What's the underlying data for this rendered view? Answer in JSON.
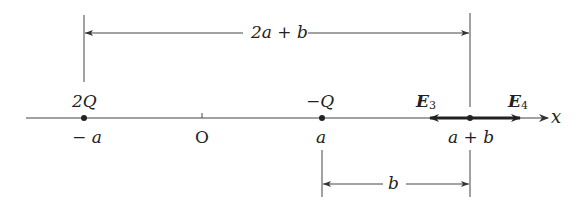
{
  "diagram": {
    "type": "point-charges-on-x-axis",
    "axis": {
      "label": "x"
    },
    "ticks": [
      {
        "id": "neg-a",
        "label": "− a",
        "x": 84
      },
      {
        "id": "origin",
        "label": "O",
        "x": 202
      },
      {
        "id": "a",
        "label": "a",
        "x": 322
      },
      {
        "id": "a-plus-b",
        "label": "a + b",
        "x": 470
      }
    ],
    "charges": [
      {
        "id": "charge-2q",
        "label": "2Q",
        "position": "−a"
      },
      {
        "id": "charge-neg-q",
        "label": "−Q",
        "position": "a"
      }
    ],
    "fields": [
      {
        "id": "e3",
        "label": "E",
        "subscript": "3",
        "direction": "left"
      },
      {
        "id": "e4",
        "label": "E",
        "subscript": "4",
        "direction": "right"
      }
    ],
    "dimensions": [
      {
        "id": "top-dimension",
        "label": "2a + b",
        "from": "−a",
        "to": "a + b"
      },
      {
        "id": "bottom-dimension",
        "label": "b",
        "from": "a",
        "to": "a + b"
      }
    ],
    "colors": {
      "line": "#333333",
      "background": "#ffffff"
    }
  }
}
